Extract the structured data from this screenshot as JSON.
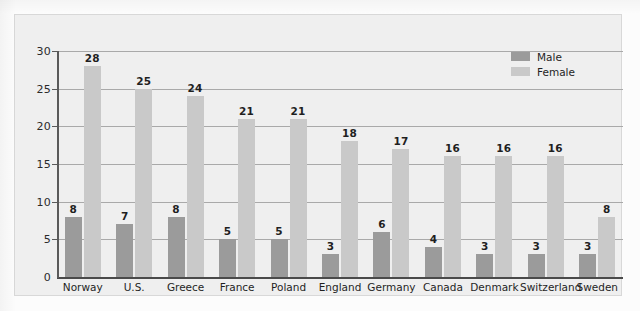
{
  "chart_data": {
    "type": "bar",
    "title": "",
    "subtitle": "",
    "xlabel": "",
    "ylabel": "",
    "ylim": [
      0,
      30
    ],
    "yticks": [
      0,
      5,
      10,
      15,
      20,
      25,
      30
    ],
    "ytick_labels": [
      "0",
      "5",
      "10",
      "15",
      "20",
      "25",
      "30"
    ],
    "grid": true,
    "legend_position": "top-right",
    "categories": [
      "Norway",
      "U.S.",
      "Greece",
      "France",
      "Poland",
      "England",
      "Germany",
      "Canada",
      "Denmark",
      "Switzerland",
      "Sweden"
    ],
    "series": [
      {
        "name": "Male",
        "color": "#9b9b9b",
        "values": [
          8,
          7,
          8,
          5,
          5,
          3,
          6,
          4,
          3,
          3,
          3
        ],
        "labels": [
          "8",
          "7",
          "8",
          "5",
          "5",
          "3",
          "6",
          "4",
          "3",
          "3",
          "3"
        ]
      },
      {
        "name": "Female",
        "color": "#c9c9c9",
        "values": [
          28,
          25,
          24,
          21,
          21,
          18,
          17,
          16,
          16,
          16,
          8
        ],
        "labels": [
          "28",
          "25",
          "24",
          "21",
          "21",
          "18",
          "17",
          "16",
          "16",
          "16",
          "8"
        ]
      }
    ]
  },
  "legend": {
    "items": [
      {
        "label": "Male",
        "color": "#9b9b9b"
      },
      {
        "label": "Female",
        "color": "#c9c9c9"
      }
    ]
  },
  "colors": {
    "plate_background": "#efefef",
    "page_background": "#fcfcfc",
    "gridline": "#a9a9a9",
    "axis": "#5a5a5a",
    "baseline": "#4a4a4a",
    "text": "#1f1f1f",
    "male_bar": "#9b9b9b",
    "female_bar": "#c9c9c9"
  }
}
